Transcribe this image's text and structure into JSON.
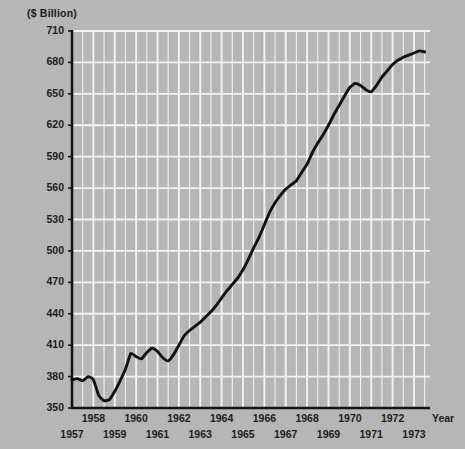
{
  "chart_data": {
    "type": "line",
    "title": "",
    "subtitle": "",
    "xlabel": "Year",
    "ylabel": "($ Billion)",
    "unit_label": "($ Billion)",
    "grid": true,
    "legend": "none",
    "xlim": [
      1957.0,
      1973.75
    ],
    "ylim": [
      350,
      710
    ],
    "ytick_step": 30,
    "yticks": [
      350,
      380,
      410,
      440,
      470,
      500,
      530,
      560,
      590,
      620,
      650,
      680,
      710
    ],
    "xticks": [
      1957,
      1958,
      1959,
      1960,
      1961,
      1962,
      1963,
      1964,
      1965,
      1966,
      1967,
      1968,
      1969,
      1970,
      1971,
      1972,
      1973
    ],
    "xticks_upper_row": [
      1958,
      1960,
      1962,
      1964,
      1966,
      1968,
      1970,
      1972
    ],
    "xticks_lower_row": [
      1957,
      1959,
      1961,
      1963,
      1965,
      1967,
      1969,
      1971,
      1973
    ],
    "gridline_minor_x_step": 0.5,
    "colors": {
      "background": "#b6b6b6",
      "gridline": "#f2f2f2",
      "axis": "#141414",
      "series": "#121212",
      "text": "#1c1c1c"
    },
    "series": [
      {
        "name": "series-1",
        "x": [
          1957.0,
          1957.25,
          1957.5,
          1957.75,
          1958.0,
          1958.25,
          1958.5,
          1958.75,
          1959.0,
          1959.25,
          1959.5,
          1959.75,
          1960.0,
          1960.25,
          1960.5,
          1960.75,
          1961.0,
          1961.25,
          1961.5,
          1961.75,
          1962.0,
          1962.25,
          1962.5,
          1962.75,
          1963.0,
          1963.25,
          1963.5,
          1963.75,
          1964.0,
          1964.25,
          1964.5,
          1964.75,
          1965.0,
          1965.25,
          1965.5,
          1965.75,
          1966.0,
          1966.25,
          1966.5,
          1966.75,
          1967.0,
          1967.25,
          1967.5,
          1967.75,
          1968.0,
          1968.25,
          1968.5,
          1968.75,
          1969.0,
          1969.25,
          1969.5,
          1969.75,
          1970.0,
          1970.25,
          1970.5,
          1970.75,
          1971.0,
          1971.25,
          1971.5,
          1971.75,
          1972.0,
          1972.25,
          1972.5,
          1972.75,
          1973.0,
          1973.25,
          1973.5
        ],
        "values": [
          377,
          378,
          376,
          380,
          377,
          362,
          357,
          358,
          366,
          376,
          387,
          402,
          399,
          397,
          403,
          407,
          404,
          398,
          395,
          401,
          410,
          419,
          424,
          428,
          432,
          437,
          442,
          448,
          455,
          462,
          468,
          474,
          482,
          492,
          503,
          513,
          525,
          537,
          546,
          553,
          559,
          563,
          567,
          575,
          583,
          594,
          603,
          611,
          620,
          630,
          639,
          648,
          656,
          660,
          658,
          654,
          652,
          658,
          666,
          672,
          678,
          682,
          685,
          687,
          689,
          691,
          690
        ]
      }
    ]
  },
  "figure": {
    "y_axis_unit_caption": "($ Billion)",
    "x_axis_caption": "Year"
  }
}
